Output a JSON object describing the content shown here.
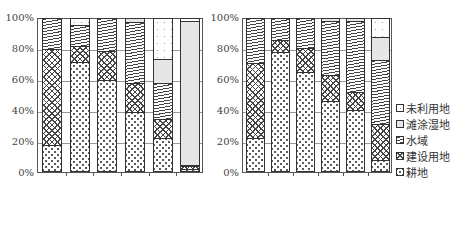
{
  "chart_data": [
    {
      "type": "bar",
      "stacked": true,
      "title": "",
      "xlabel": "",
      "ylabel": "",
      "ylim": [
        0,
        100
      ],
      "yticks": [
        "0%",
        "20%",
        "40%",
        "60%",
        "80%",
        "100%"
      ],
      "categories": [
        "1950–1960",
        "1961–1970",
        "1971–1980",
        "1981–1990",
        "1991–2000",
        "2001–2010"
      ],
      "series": [
        {
          "name": "耕地",
          "values": [
            17,
            72,
            60,
            39,
            22,
            1
          ]
        },
        {
          "name": "建设用地",
          "values": [
            63,
            10,
            19,
            19,
            12,
            2
          ]
        },
        {
          "name": "水域",
          "values": [
            20,
            14,
            21,
            40,
            24,
            1
          ]
        },
        {
          "name": "滩涂湿地",
          "values": [
            0,
            0,
            0,
            2,
            16,
            95
          ]
        },
        {
          "name": "未利用地",
          "values": [
            0,
            4,
            0,
            0,
            26,
            1
          ]
        }
      ],
      "grid": true
    },
    {
      "type": "bar",
      "stacked": true,
      "title": "",
      "xlabel": "",
      "ylabel": "",
      "ylim": [
        0,
        100
      ],
      "yticks": [
        "0%",
        "20%",
        "40%",
        "60%",
        "80%",
        "100%"
      ],
      "categories": [
        "1950–1960",
        "1961–1970",
        "1971–1980",
        "1981–1990",
        "1991–2000",
        "2001–2010"
      ],
      "series": [
        {
          "name": "耕地",
          "values": [
            22,
            78,
            65,
            46,
            40,
            7
          ]
        },
        {
          "name": "建设用地",
          "values": [
            49,
            8,
            16,
            17,
            12,
            24
          ]
        },
        {
          "name": "水域",
          "values": [
            29,
            14,
            19,
            36,
            47,
            42
          ]
        },
        {
          "name": "滩涂湿地",
          "values": [
            0,
            0,
            0,
            1,
            1,
            15
          ]
        },
        {
          "name": "未利用地",
          "values": [
            0,
            0,
            0,
            0,
            0,
            12
          ]
        }
      ],
      "grid": true,
      "legend_position": "right"
    }
  ],
  "legend": {
    "items": [
      {
        "label": "未利用地",
        "pattern": "unused"
      },
      {
        "label": "滩涂湿地",
        "pattern": "wetland"
      },
      {
        "label": "水域",
        "pattern": "water"
      },
      {
        "label": "建设用地",
        "pattern": "construction"
      },
      {
        "label": "耕地",
        "pattern": "farmland"
      }
    ]
  }
}
